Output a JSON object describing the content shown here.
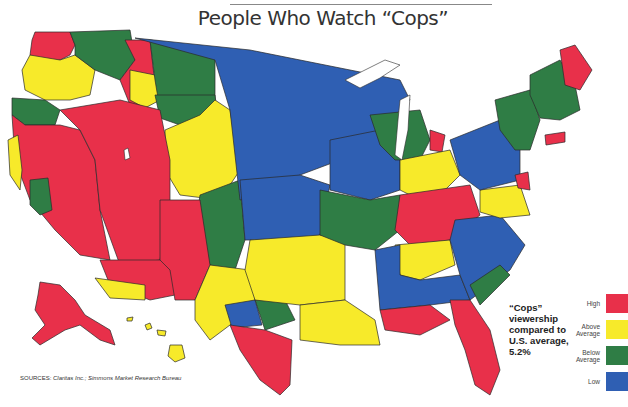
{
  "title": "People Who Watch “Cops”",
  "note": {
    "lines": [
      "“Cops”",
      "viewership",
      "compared to",
      "U.S. average,",
      "5.2%"
    ]
  },
  "legend": {
    "items": [
      {
        "key": "high",
        "label": "High",
        "color": "#e8304a"
      },
      {
        "key": "above",
        "label": "Above Average",
        "color": "#f7ea2a"
      },
      {
        "key": "below",
        "label": "Below Average",
        "color": "#2f7d45"
      },
      {
        "key": "low",
        "label": "Low",
        "color": "#2f5fb3"
      }
    ]
  },
  "sources": {
    "prefix": "SOURCES:",
    "text": "Claritas Inc.; Simmons Market Research Bureau"
  },
  "map": {
    "region_categories": {
      "pacific_nw_coast": "high",
      "wa_east": "below",
      "or_west": "above",
      "or_sw": "below",
      "id_north": "high",
      "id_central": "above",
      "mt_west": "below",
      "mt_east": "below",
      "nd_sd_mn": "low",
      "wy_co_north": "above",
      "ne_ks": "low",
      "ca_north": "high",
      "ca_central_coast": "above",
      "ca_sierra": "below",
      "nevada_utah": "high",
      "az": "high",
      "az_south": "above",
      "nm": "high",
      "co_east": "below",
      "ok_ar": "above",
      "tx_west": "above",
      "tx_south": "high",
      "tx_central_blue": "low",
      "tx_green": "below",
      "la_ms": "above",
      "mo_il_green": "below",
      "ia_wi": "low",
      "mi": "below",
      "mi_red": "high",
      "oh_in_yellow": "above",
      "ky_tn_red": "high",
      "tn_yellow": "above",
      "al_ga_blue": "low",
      "gulf_red": "high",
      "florida": "high",
      "carolinas_blue": "low",
      "sc_coast_green": "below",
      "va_yellow": "above",
      "pa_ny_blue": "low",
      "ny_green": "below",
      "new_england_green": "below",
      "maine": "high",
      "ct_red": "high",
      "nj_md_red": "high",
      "alaska": "high",
      "hawaii": "above"
    }
  }
}
